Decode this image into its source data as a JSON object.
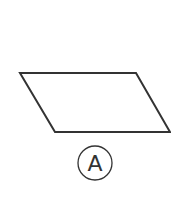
{
  "figure": {
    "shape": "parallelogram",
    "stroke_color": "#333333",
    "label": "A",
    "points": "20,73 136,73 170,132 55,132"
  }
}
